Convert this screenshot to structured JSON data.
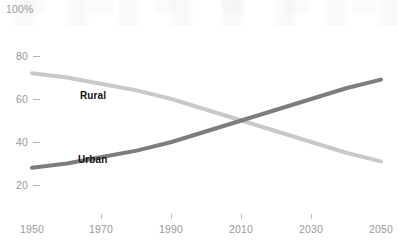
{
  "chart_data": {
    "type": "line",
    "title": "",
    "subtitle": "",
    "xlabel": "",
    "ylabel": "",
    "ylim": [
      0,
      100
    ],
    "xlim": [
      1950,
      2050
    ],
    "y_axis_top_label": "100%",
    "y_ticks": [
      80,
      60,
      40,
      20
    ],
    "y_tick_labels": [
      "80",
      "60",
      "40",
      "20"
    ],
    "x_ticks": [
      1950,
      1970,
      1990,
      2010,
      2030,
      2050
    ],
    "x_tick_labels": [
      "1950",
      "1970",
      "1990",
      "2010",
      "2030",
      "2050"
    ],
    "grid": false,
    "legend_position": "inline",
    "x": [
      1950,
      1960,
      1970,
      1980,
      1990,
      2000,
      2010,
      2020,
      2030,
      2040,
      2050
    ],
    "series": [
      {
        "name": "Rural",
        "label": "Rural",
        "color": "#c9c9c9",
        "values": [
          72,
          70,
          67,
          64,
          60,
          55,
          50,
          45,
          40,
          35,
          31
        ]
      },
      {
        "name": "Urban",
        "label": "Urban",
        "color": "#7d7d7d",
        "values": [
          28,
          30,
          33,
          36,
          40,
          45,
          50,
          55,
          60,
          65,
          69
        ]
      }
    ],
    "annotations": [
      {
        "text": "Rural",
        "x": 1972,
        "y": 62
      },
      {
        "text": "Urban",
        "x": 1971,
        "y": 35
      }
    ]
  },
  "axis": {
    "top_label": "100%",
    "y_labels": [
      "80",
      "60",
      "40",
      "20"
    ],
    "x_labels": [
      "1950",
      "1970",
      "1990",
      "2010",
      "2030",
      "2050"
    ]
  },
  "labels": {
    "rural": "Rural",
    "urban": "Urban"
  },
  "colors": {
    "rural_line": "#c9c9c9",
    "urban_line": "#7d7d7d",
    "axis_text": "#9a9a9a",
    "label_text": "#111111",
    "background": "#ffffff"
  }
}
